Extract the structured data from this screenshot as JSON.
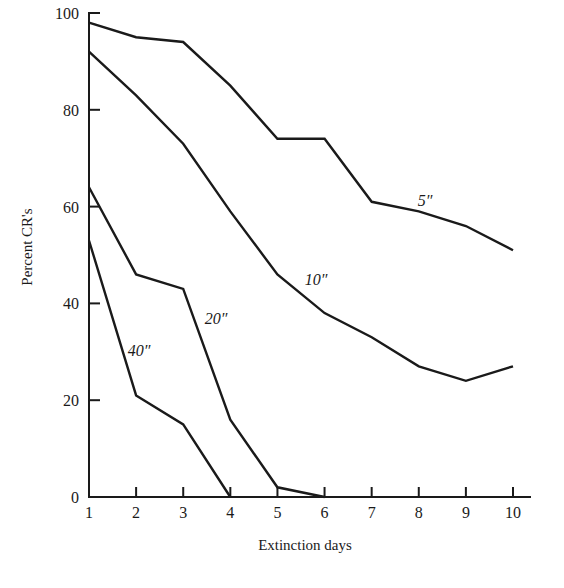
{
  "chart_data": {
    "type": "line",
    "title": "",
    "xlabel": "Extinction days",
    "ylabel": "Percent CR's",
    "x": [
      1,
      2,
      3,
      4,
      5,
      6,
      7,
      8,
      9,
      10
    ],
    "xticks": [
      "1",
      "2",
      "3",
      "4",
      "5",
      "6",
      "7",
      "8",
      "9",
      "10"
    ],
    "yticks": [
      "0",
      "20",
      "40",
      "60",
      "80",
      "100"
    ],
    "ylim": [
      0,
      100
    ],
    "xlim": [
      1,
      10
    ],
    "grid": false,
    "legend": "inline labels",
    "series": [
      {
        "name": "5″",
        "label_pos": [
          425,
          206
        ],
        "x": [
          1,
          2,
          3,
          4,
          5,
          6,
          7,
          8,
          9,
          10
        ],
        "values": [
          98,
          95,
          94,
          85,
          74,
          74,
          61,
          59,
          56,
          51
        ]
      },
      {
        "name": "10″",
        "label_pos": [
          316,
          285
        ],
        "x": [
          1,
          2,
          3,
          4,
          5,
          6,
          7,
          8,
          9,
          10
        ],
        "values": [
          92,
          83,
          73,
          59,
          46,
          38,
          33,
          27,
          24,
          27
        ]
      },
      {
        "name": "20″",
        "label_pos": [
          216,
          324
        ],
        "x": [
          1,
          2,
          3,
          4,
          5,
          6
        ],
        "values": [
          64,
          46,
          43,
          16,
          2,
          0
        ]
      },
      {
        "name": "40″",
        "label_pos": [
          139,
          356
        ],
        "x": [
          1,
          2,
          3,
          4
        ],
        "values": [
          53,
          21,
          15,
          0
        ]
      }
    ]
  }
}
